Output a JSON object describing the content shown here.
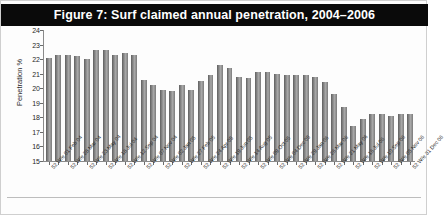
{
  "figure": {
    "title": "Figure 7: Surf claimed annual penetration, 2004–2006",
    "title_bar_color": "#0a0a0a",
    "title_text_color": "#ffffff",
    "bar_color": "#8f8f8f",
    "axis_color": "#8a8a8a",
    "background": "#ffffff"
  },
  "chart_data": {
    "type": "bar",
    "title": "Figure 7: Surf claimed annual penetration, 2004–2006",
    "xlabel": "",
    "ylabel": "Penetration %",
    "ylim": [
      15,
      24
    ],
    "yticks": [
      15,
      16,
      17,
      18,
      19,
      20,
      21,
      22,
      23,
      24
    ],
    "ytick_labels": [
      "15",
      "16",
      "17",
      "18",
      "19",
      "20",
      "21",
      "22",
      "23",
      "24"
    ],
    "grid": false,
    "legend": false,
    "categories": [
      "52 W/e 01 Feb 04",
      "52 W/e 29 Feb 04",
      "52 W/e 28 Mar 04",
      "52 W/e 25 Apr 04",
      "52 W/e 23 May 04",
      "52 W/e 20 Jun 04",
      "52 W/e 18 Jul 04",
      "52 W/e 15 Aug 04",
      "52 W/e 12 Sep 04",
      "52 W/e 10 Oct 04",
      "52 W/e 07 Nov 04",
      "52 W/e 05 Dec 04",
      "52 W/e 02 Jan 05",
      "52 W/e 30 Jan 05",
      "52 W/e 27 Feb 05",
      "52 W/e 27 Mar 05",
      "52 W/e 24 Apr 05",
      "52 W/e 22 May 05",
      "52 W/e 19 Jun 05",
      "52 W/e 17 Jul 05",
      "52 W/e 14 Aug 05",
      "52 W/e 11 Sep 05",
      "52 W/e 09 Oct 05",
      "52 W/e 06 Nov 05",
      "52 W/e 04 Dec 05",
      "52 W/e 01 Jan 06",
      "52 W/e 29 Jan 06",
      "52 W/e 26 Feb 06",
      "52 W/e 26 Mar 06",
      "52 W/e 23 Apr 06",
      "52 W/e 21 May 06",
      "52 W/e 18 Jun 06",
      "52 W/e 16 Jul 06",
      "52 W/e 13 Aug 06",
      "52 W/e 10 Sep 06",
      "52 W/e 08 Oct 06",
      "52 W/e 05 Nov 06",
      "52 W/e 03 Dec 06",
      "52 W/e 31 Dec 06"
    ],
    "visible_tick_labels": [
      "52 W/e 01 Feb 04",
      "52 W/e 28 Mar 04",
      "52 W/e 23 May 04",
      "52 W/e 18 Jul 04",
      "52 W/e 12 Sep 04",
      "52 W/e 07 Nov 04",
      "52 W/e 02 Jan 05",
      "52 W/e 27 Feb 05",
      "52 W/e 24 Apr 05",
      "52 W/e 19 Jun 05",
      "52 W/e 14 Aug 05",
      "52 W/e 09 Oct 05",
      "52 W/e 04 Dec 05",
      "52 W/e 29 Jan 06",
      "52 W/e 26 Mar 06",
      "52 W/e 21 May 06",
      "52 W/e 16 Jul 06",
      "52 W/e 10 Sep 06",
      "52 W/e 05 Nov 06",
      "52 W/e 31 Dec 06"
    ],
    "values": [
      22.1,
      22.3,
      22.3,
      22.2,
      22.0,
      22.6,
      22.6,
      22.3,
      22.4,
      22.3,
      20.6,
      20.2,
      19.9,
      19.8,
      20.2,
      19.9,
      20.5,
      20.9,
      21.6,
      21.4,
      20.8,
      20.7,
      21.1,
      21.1,
      21.0,
      20.9,
      20.9,
      20.9,
      20.8,
      20.4,
      19.6,
      18.7,
      17.4,
      17.9,
      18.2,
      18.2,
      18.1,
      18.2,
      18.2
    ]
  }
}
